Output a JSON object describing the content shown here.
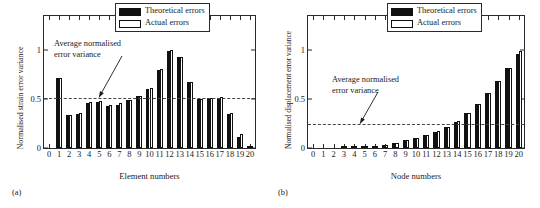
{
  "figure": {
    "panels": [
      {
        "caption": "(a)",
        "chart_data": {
          "type": "bar",
          "title": "",
          "xlabel": "Element numbers",
          "ylabel": "Normalised strain error variance",
          "xlim": [
            0,
            20
          ],
          "ylim": [
            0,
            1.35
          ],
          "yticks": [
            0,
            0.5,
            1
          ],
          "ytick_labels": [
            "0",
            "0.5",
            "1"
          ],
          "categories": [
            "0",
            "1",
            "2",
            "3",
            "4",
            "5",
            "6",
            "7",
            "8",
            "9",
            "10",
            "11",
            "12",
            "13",
            "14",
            "15",
            "16",
            "17",
            "18",
            "19",
            "20"
          ],
          "grid": false,
          "legend_position": "top-right",
          "series": [
            {
              "name": "Theoretical errors",
              "color": "#111111",
              "values": [
                0.0,
                0.72,
                0.34,
                0.35,
                0.46,
                0.47,
                0.43,
                0.44,
                0.49,
                0.53,
                0.6,
                0.8,
                0.99,
                0.93,
                0.68,
                0.5,
                0.51,
                0.51,
                0.35,
                0.11,
                0.01
              ]
            },
            {
              "name": "Actual errors",
              "color": "#ffffff",
              "values": [
                0.0,
                0.72,
                0.34,
                0.36,
                0.47,
                0.48,
                0.44,
                0.46,
                0.49,
                0.53,
                0.61,
                0.81,
                1.0,
                0.93,
                0.68,
                0.5,
                0.51,
                0.52,
                0.36,
                0.14,
                0.01
              ]
            }
          ],
          "annotations": [
            {
              "text_line1": "Average normalised",
              "text_line2": "error variance",
              "value": 0.51,
              "style": "dashed-horizontal-line-with-arrow"
            }
          ]
        }
      },
      {
        "caption": "(b)",
        "chart_data": {
          "type": "bar",
          "title": "",
          "xlabel": "Node numbers",
          "ylabel": "Normalised displacement error variance",
          "xlim": [
            0,
            20
          ],
          "ylim": [
            0,
            1.35
          ],
          "yticks": [
            0,
            0.5,
            1
          ],
          "ytick_labels": [
            "0",
            "0.5",
            "1"
          ],
          "categories": [
            "0",
            "1",
            "2",
            "3",
            "4",
            "5",
            "6",
            "7",
            "8",
            "9",
            "10",
            "11",
            "12",
            "13",
            "14",
            "15",
            "16",
            "17",
            "18",
            "19",
            "20"
          ],
          "grid": false,
          "legend_position": "top-right",
          "series": [
            {
              "name": "Theoretical errors",
              "color": "#111111",
              "values": [
                0.0,
                0.0,
                0.0,
                0.001,
                0.003,
                0.008,
                0.016,
                0.03,
                0.05,
                0.077,
                0.1,
                0.13,
                0.165,
                0.215,
                0.27,
                0.355,
                0.45,
                0.56,
                0.685,
                0.815,
                0.965
              ]
            },
            {
              "name": "Actual errors",
              "color": "#ffffff",
              "values": [
                0.0,
                0.0,
                0.0,
                0.001,
                0.004,
                0.01,
                0.018,
                0.032,
                0.055,
                0.08,
                0.105,
                0.135,
                0.17,
                0.22,
                0.28,
                0.36,
                0.455,
                0.565,
                0.69,
                0.82,
                0.99
              ]
            }
          ],
          "annotations": [
            {
              "text_line1": "Average normalised",
              "text_line2": "error variance",
              "value": 0.245,
              "style": "dashed-horizontal-line-with-arrow"
            }
          ]
        }
      }
    ]
  }
}
